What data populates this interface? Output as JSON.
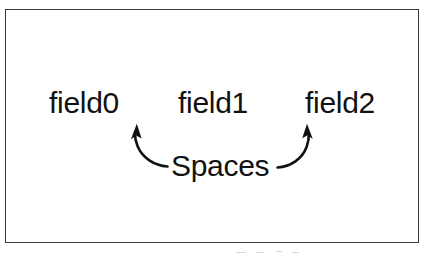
{
  "figure": {
    "background_color": "#ffffff",
    "frame": {
      "border_color": "#3a3a3c",
      "fill_color": "#ffffff"
    },
    "text_color": "#121212"
  },
  "fields": [
    {
      "label": "field0"
    },
    {
      "label": "field1"
    },
    {
      "label": "field2"
    }
  ],
  "annotation": {
    "label": "Spaces",
    "arrows": [
      {
        "name": "left-arrow",
        "direction": "up-left",
        "points_to": "gap-between-field0-and-field1"
      },
      {
        "name": "right-arrow",
        "direction": "up-right",
        "points_to": "gap-between-field1-and-field2"
      }
    ],
    "arrow_color": "#121212"
  }
}
